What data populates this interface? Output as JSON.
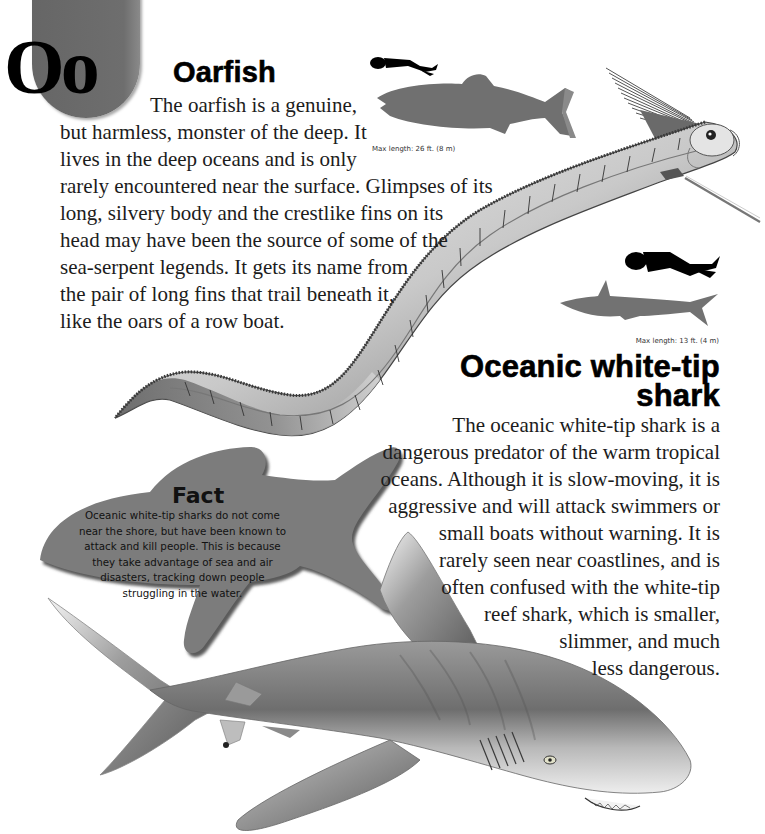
{
  "page": {
    "letter_badge": "Oo",
    "colors": {
      "badge_gray": "#6a6a6a",
      "silhouette_gray": "#6f6f6f",
      "fact_bubble_gray": "#7a7a7a",
      "text": "#1c1c1c"
    }
  },
  "oarfish": {
    "title": "Oarfish",
    "lines": [
      "The oarfish is a genuine,",
      "but harmless, monster of the deep. It",
      "lives in the deep oceans and is only",
      "rarely encountered near the surface. Glimpses of its",
      "long, silvery body and the crestlike fins on its",
      "head may have been the source of some of the",
      "sea-serpent legends. It gets its name from",
      "the pair of long fins that trail beneath it,",
      "like the oars of a row boat."
    ],
    "size_caption": "Max length: 26 ft. (8 m)",
    "icons": [
      "diver-silhouette-icon",
      "oarfish-silhouette-icon",
      "oarfish-illustration"
    ]
  },
  "shark": {
    "title_line1": "Oceanic white-tip",
    "title_line2": "shark",
    "lines": [
      "The oceanic white-tip shark is a",
      "dangerous predator of the warm tropical",
      "oceans. Although it is slow-moving, it is",
      "aggressive and will attack swimmers or",
      "small boats without warning. It is",
      "rarely seen near coastlines, and is",
      "often confused with the white-tip",
      "reef shark, which is smaller,",
      "slimmer, and much",
      "less dangerous."
    ],
    "size_caption": "Max length: 13 ft. (4 m)",
    "icons": [
      "diver-silhouette-icon",
      "shark-silhouette-icon",
      "shark-illustration"
    ]
  },
  "fact": {
    "title": "Fact",
    "lines": [
      "Oceanic white-tip sharks do not come",
      "near the shore, but have been known to",
      "attack and kill people. This is because",
      "they take advantage of sea and air",
      "disasters, tracking down people",
      "struggling in the water."
    ]
  }
}
